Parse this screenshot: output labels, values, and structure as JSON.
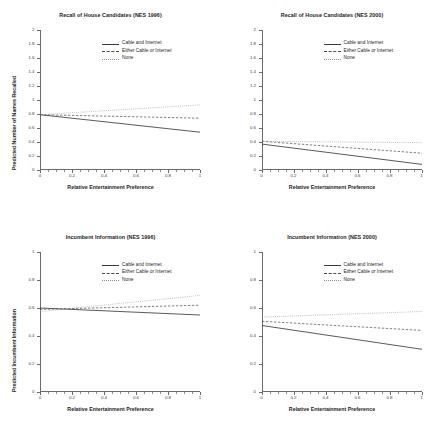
{
  "figure": {
    "background": "#ffffff",
    "series_styles": {
      "cable_and_internet": {
        "dash": "solid",
        "color": "#3c3c3c"
      },
      "either_cable_or_internet": {
        "dash": "dashed",
        "color": "#4a4a4a"
      },
      "none": {
        "dash": "dotted",
        "color": "#8a8a8a"
      }
    }
  },
  "legend": {
    "entries": [
      {
        "label": "Cable and Internet",
        "key": "solid"
      },
      {
        "label": "Either Cable or Internet",
        "key": "dashed"
      },
      {
        "label": "None",
        "key": "dotted"
      }
    ]
  },
  "chart_data": [
    {
      "type": "line",
      "panel": "top-left",
      "title": "Recall of House Candidates (NES 1996)",
      "xlabel": "Relative Entertainment Preference",
      "ylabel": "Predicted Number of Names Recalled",
      "xlim": [
        0,
        1
      ],
      "ylim": [
        0,
        2
      ],
      "xticks": [
        0,
        0.2,
        0.4,
        0.6,
        0.8,
        1
      ],
      "xticklabels": [
        "0",
        "0.2",
        "0.4",
        "0.6",
        "0.8",
        "1"
      ],
      "yticks": [
        0,
        0.2,
        0.4,
        0.6,
        0.8,
        1,
        1.2,
        1.4,
        1.6,
        1.8,
        2
      ],
      "yticklabels": [
        "0",
        "0.2",
        "0.4",
        "0.6",
        "0.8",
        "1",
        "1.2",
        "1.4",
        "1.6",
        "1.8",
        "2"
      ],
      "grid": false,
      "legend_position": "upper-right",
      "x": [
        0,
        1
      ],
      "series": [
        {
          "name": "Cable and Internet",
          "values": [
            0.79,
            0.54
          ]
        },
        {
          "name": "Either Cable or Internet",
          "values": [
            0.79,
            0.74
          ]
        },
        {
          "name": "None",
          "values": [
            0.79,
            0.93
          ]
        }
      ]
    },
    {
      "type": "line",
      "panel": "top-right",
      "title": "Recall of House Candidates (NES 2000)",
      "xlabel": "Relative Entertainment Preference",
      "ylabel": "",
      "xlim": [
        0,
        1
      ],
      "ylim": [
        0,
        2
      ],
      "xticks": [
        0,
        0.2,
        0.4,
        0.6,
        0.8,
        1
      ],
      "xticklabels": [
        "0",
        "0.2",
        "0.4",
        "0.6",
        "0.8",
        "1"
      ],
      "yticks": [
        0,
        0.2,
        0.4,
        0.6,
        0.8,
        1,
        1.2,
        1.4,
        1.6,
        1.8,
        2
      ],
      "yticklabels": [
        "0",
        "0.2",
        "0.4",
        "0.6",
        "0.8",
        "1",
        "1.2",
        "1.4",
        "1.6",
        "1.8",
        "2"
      ],
      "grid": false,
      "legend_position": "upper-right",
      "x": [
        0,
        1
      ],
      "series": [
        {
          "name": "Cable and Internet",
          "values": [
            0.37,
            0.08
          ]
        },
        {
          "name": "Either Cable or Internet",
          "values": [
            0.41,
            0.24
          ]
        },
        {
          "name": "None",
          "values": [
            0.41,
            0.39
          ]
        }
      ]
    },
    {
      "type": "line",
      "panel": "bottom-left",
      "title": "Incumbent Information (NES 1996)",
      "xlabel": "Relative Entertainment Preference",
      "ylabel": "Predicted Incumbent Information",
      "xlim": [
        0,
        1
      ],
      "ylim": [
        0,
        1
      ],
      "xticks": [
        0,
        0.2,
        0.4,
        0.6,
        0.8,
        1
      ],
      "xticklabels": [
        "0",
        "0.2",
        "0.4",
        "0.6",
        "0.8",
        "1"
      ],
      "yticks": [
        0,
        0.2,
        0.4,
        0.6,
        0.8,
        1
      ],
      "yticklabels": [
        "0",
        "0.2",
        "0.4",
        "0.6",
        "0.8",
        "1"
      ],
      "grid": false,
      "legend_position": "upper-right",
      "x": [
        0,
        1
      ],
      "series": [
        {
          "name": "Cable and Internet",
          "values": [
            0.6,
            0.55
          ]
        },
        {
          "name": "Either Cable or Internet",
          "values": [
            0.59,
            0.62
          ]
        },
        {
          "name": "None",
          "values": [
            0.575,
            0.69
          ]
        }
      ]
    },
    {
      "type": "line",
      "panel": "bottom-right",
      "title": "Incumbent Information (NES 2000)",
      "xlabel": "Relative Entertainment Preference",
      "ylabel": "",
      "xlim": [
        0,
        1
      ],
      "ylim": [
        0,
        1
      ],
      "xticks": [
        0,
        0.2,
        0.4,
        0.6,
        0.8,
        1
      ],
      "xticklabels": [
        "0",
        "0.2",
        "0.4",
        "0.6",
        "0.8",
        "1"
      ],
      "yticks": [
        0,
        0.2,
        0.4,
        0.6,
        0.8,
        1
      ],
      "yticklabels": [
        "0",
        "0.2",
        "0.4",
        "0.6",
        "0.8",
        "1"
      ],
      "grid": false,
      "legend_position": "upper-right",
      "x": [
        0,
        1
      ],
      "series": [
        {
          "name": "Cable and Internet",
          "values": [
            0.475,
            0.305
          ]
        },
        {
          "name": "Either Cable or Internet",
          "values": [
            0.505,
            0.44
          ]
        },
        {
          "name": "None",
          "values": [
            0.535,
            0.575
          ]
        }
      ]
    }
  ]
}
